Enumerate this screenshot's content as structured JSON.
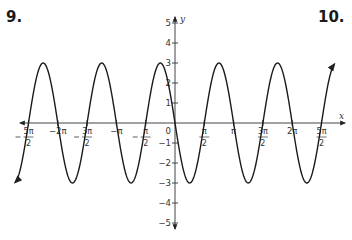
{
  "problems": {
    "left_number": "9.",
    "right_number": "10."
  },
  "chart_data": {
    "type": "line",
    "title": "",
    "function": "y = -3 sin(2x)",
    "xlabel": "x",
    "ylabel": "y",
    "xlim": [
      -2.75,
      2.9
    ],
    "xlim_units": "pi",
    "ylim": [
      -5,
      5
    ],
    "grid": false,
    "x_tick_labels": [
      "-5π/2",
      "-2π",
      "-3π/2",
      "-π",
      "-π/2",
      "0",
      "π/2",
      "π",
      "3π/2",
      "2π",
      "5π/2"
    ],
    "x_tick_values_pi": [
      -2.5,
      -2,
      -1.5,
      -1,
      -0.5,
      0,
      0.5,
      1,
      1.5,
      2,
      2.5
    ],
    "y_tick_labels": [
      "5",
      "4",
      "3",
      "2",
      "1",
      "-1",
      "-2",
      "-3",
      "-4",
      "-5"
    ],
    "y_tick_values": [
      5,
      4,
      3,
      2,
      1,
      -1,
      -2,
      -3,
      -4,
      -5
    ],
    "amplitude": 3,
    "period": "π",
    "series": [
      {
        "name": "curve",
        "x_pi": [
          -2.25,
          -1.75,
          -1.25,
          -0.75,
          -0.25,
          0.25,
          0.75,
          1.25,
          1.75,
          2.25
        ],
        "y": [
          3,
          -3,
          3,
          -3,
          3,
          -3,
          3,
          -3,
          3,
          -3
        ]
      }
    ]
  }
}
